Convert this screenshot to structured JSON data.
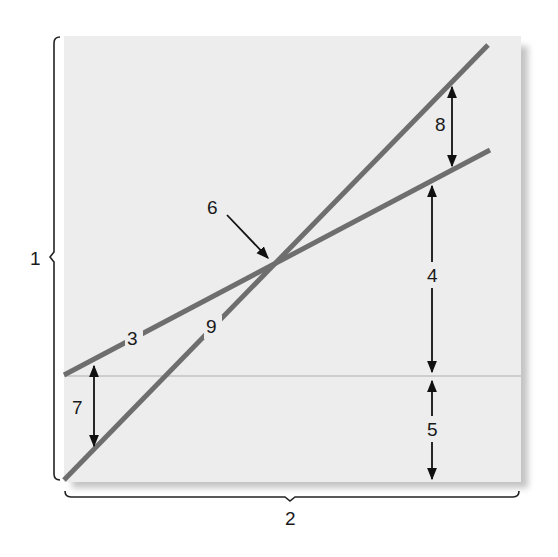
{
  "diagram": {
    "colors": {
      "background": "#ffffff",
      "panel": "#ececec",
      "panel_shadow": "#c8c8c8",
      "line_color": "#6e6e6e",
      "midline": "#cfcfcf",
      "arrow": "#111111",
      "brace": "#222222"
    },
    "labels": {
      "brace_vertical": "1",
      "brace_horizontal": "2",
      "shallow_line": "3",
      "upper_gap": "4",
      "lower_gap": "5",
      "intersection": "6",
      "left_gap": "7",
      "right_gap": "8",
      "steep_line": "9"
    },
    "lines": [
      {
        "name": "line-3-shallow",
        "x1": 64,
        "y1": 375,
        "x2": 490,
        "y2": 150
      },
      {
        "name": "line-9-steep",
        "x1": 64,
        "y1": 480,
        "x2": 488,
        "y2": 45
      }
    ],
    "intersection_point": {
      "x": 272,
      "y": 262
    }
  }
}
